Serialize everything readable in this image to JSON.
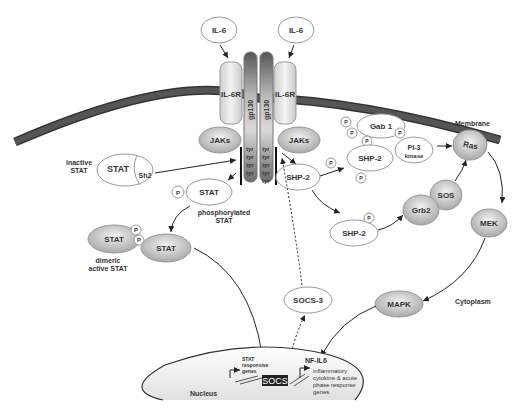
{
  "diagram": {
    "type": "signaling-pathway",
    "ligands": [
      {
        "label": "IL-6"
      },
      {
        "label": "IL-6"
      }
    ],
    "receptors": [
      {
        "label": "IL-6R"
      },
      {
        "label": "IL-6R"
      }
    ],
    "transducers": [
      {
        "label": "gp130"
      },
      {
        "label": "gp130"
      }
    ],
    "tyr_label": "tyr",
    "kinases": [
      {
        "label": "JAKs"
      },
      {
        "label": "JAKs"
      }
    ],
    "compartments": {
      "membrane": "Membrane",
      "cytoplasm": "Cytoplasm",
      "nucleus": "Nucleus"
    },
    "stat": {
      "inactive_label": "inactive\nSTAT",
      "inactive_line1": "inactive",
      "inactive_line2": "STAT",
      "stat": "STAT",
      "sh2": "Sh2",
      "phosphorylated_line1": "phosphorylated",
      "phosphorylated_line2": "STAT",
      "dimeric_line1": "dimeric",
      "dimeric_line2": "active STAT"
    },
    "phospho": "P",
    "right_branch": {
      "gab1": "Gab 1",
      "shp2": "SHP-2",
      "pi3k_line1": "PI-3",
      "pi3k_line2": "kinase",
      "ras": "Ras",
      "sos": "SOS",
      "grb2": "Grb2",
      "mek": "MEK",
      "mapk": "MAPK"
    },
    "socs3": "SOCS-3",
    "nucleus": {
      "stat_genes_line1": "STAT",
      "stat_genes_line2": "responsive",
      "stat_genes_line3": "genes",
      "socs_gene": "SOCS",
      "nfil6": "NF-IL6",
      "inflam_line1": "inflammatory",
      "inflam_line2": "cytokine & acute",
      "inflam_line3": "phase response",
      "inflam_line4": "genes"
    }
  }
}
